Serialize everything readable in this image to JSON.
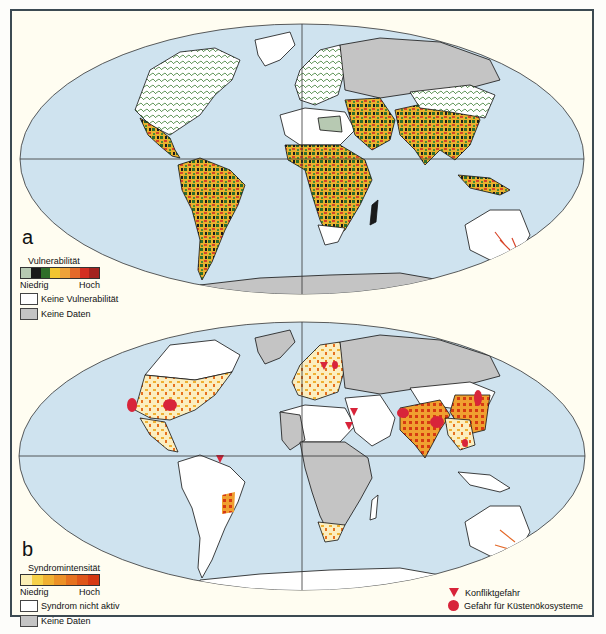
{
  "colors": {
    "ocean": "#cfe3ef",
    "land_none": "#ffffff",
    "no_data": "#c4c4c4",
    "frame_bg": "#fffdf1",
    "frame_border": "#3c4a52",
    "hazard_red": "#d8243a"
  },
  "panel_a": {
    "letter": "a",
    "legend": {
      "title": "Vulnerabilität",
      "scale_colors": [
        "#b7c9b2",
        "#1a1a1a",
        "#2f6e2a",
        "#4a8a35",
        "#f2c531",
        "#eea23a",
        "#e46a2a",
        "#d32e22",
        "#a3231f"
      ],
      "low_label": "Niedrig",
      "high_label": "Hoch",
      "items": [
        {
          "label": "Keine Vulnerabilität",
          "color": "#ffffff"
        },
        {
          "label": "Keine Daten",
          "color": "#c4c4c4"
        }
      ]
    }
  },
  "panel_b": {
    "letter": "b",
    "legend": {
      "title": "Syndromintensität",
      "scale_colors": [
        "#fbeeb4",
        "#f6d148",
        "#f0b032",
        "#ec9127",
        "#e6721f",
        "#df5618",
        "#d63a12"
      ],
      "low_label": "Niedrig",
      "high_label": "Hoch",
      "items": [
        {
          "label": "Syndrom nicht aktiv",
          "color": "#ffffff"
        },
        {
          "label": "Keine Daten",
          "color": "#c4c4c4"
        }
      ]
    },
    "symbols": [
      {
        "shape": "triangle",
        "label": "Konfliktgefahr"
      },
      {
        "shape": "circle",
        "label": "Gefahr für Küstenökosysteme"
      }
    ]
  }
}
